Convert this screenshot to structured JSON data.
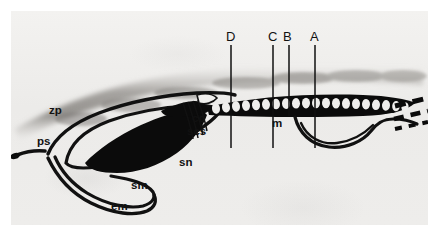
{
  "figure": {
    "kind": "electron-micrograph-line-diagram",
    "background_color": "#efeeec",
    "ink_color": "#111111",
    "margin_color": "#ffffff"
  },
  "anatomical_labels": [
    {
      "key": "zp",
      "text": "zp",
      "x": 48,
      "y": 110,
      "meaning": "zona pellucida"
    },
    {
      "key": "ps",
      "text": "ps",
      "x": 36,
      "y": 141,
      "meaning": "primitive streak"
    },
    {
      "key": "cc",
      "text": "cc",
      "x": 191,
      "y": 117,
      "meaning": "central canal"
    },
    {
      "key": "scs",
      "text": "scs",
      "x": 186,
      "y": 130,
      "meaning": "subcephalic space"
    },
    {
      "key": "sn",
      "text": "sn",
      "x": 178,
      "y": 161,
      "meaning": "subnotochordal mass"
    },
    {
      "key": "sm",
      "text": "sm",
      "x": 130,
      "y": 184,
      "meaning": "splanchnic mesoderm"
    },
    {
      "key": "em",
      "text": "em",
      "x": 110,
      "y": 205,
      "meaning": "endoderm / embryonic membrane"
    },
    {
      "key": "m",
      "text": "m",
      "x": 271,
      "y": 122,
      "meaning": "mesoderm"
    }
  ],
  "section_planes": [
    {
      "label": "D",
      "letter_x": 227,
      "letter_y": 40,
      "line_x": 231,
      "line_top": 45,
      "line_bottom": 148
    },
    {
      "label": "C",
      "letter_x": 269,
      "letter_y": 40,
      "line_x": 273,
      "line_top": 45,
      "line_bottom": 148
    },
    {
      "label": "B",
      "letter_x": 284,
      "letter_y": 40,
      "line_x": 289,
      "line_top": 45,
      "line_bottom": 116
    },
    {
      "label": "A",
      "letter_x": 311,
      "letter_y": 40,
      "line_x": 315,
      "line_top": 45,
      "line_bottom": 148
    }
  ],
  "somites": {
    "count": 22,
    "description": "chain of pale oval somites within a dark band running posteriorly"
  },
  "trailing_marks": {
    "description": "dashed broken lines at the posterior (right) end indicating continuation"
  }
}
